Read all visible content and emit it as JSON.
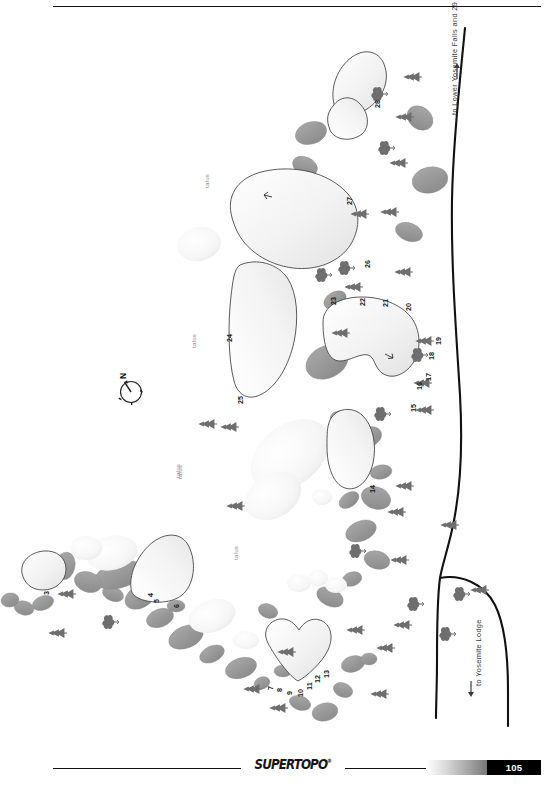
{
  "page": {
    "publisher": "SUPERTOPO",
    "registered_mark": "®",
    "page_number": "105",
    "orientation": "landscape-rotated-90"
  },
  "map": {
    "title": "Camp 4 Bouldering Area Topo Map",
    "compass": {
      "label": "N"
    },
    "talus_labels": [
      "talus",
      "talus",
      "talus",
      "talus",
      "talus"
    ],
    "directions": [
      {
        "id": "to-lower-yosemite-falls",
        "text": "to Lower Yosemite Falls and 29",
        "arrow": "up"
      },
      {
        "id": "to-yosemite-lodge",
        "text": "to Yosemite Lodge",
        "arrow": "down"
      }
    ],
    "route_numbers": [
      "3",
      "4",
      "5",
      "6",
      "7",
      "8",
      "9",
      "10",
      "11",
      "12",
      "13",
      "14",
      "15",
      "16",
      "17",
      "18",
      "19",
      "20",
      "21",
      "22",
      "23",
      "24",
      "25",
      "26",
      "27",
      "28"
    ],
    "colors": {
      "boulder_outline": "#3a3a3a",
      "boulder_fill_light": "#f3f3f3",
      "boulder_fill_shadow": "#9a9a9a",
      "tree": "#6b6b6b",
      "bush": "#6b6b6b",
      "trail": "#111111",
      "talus_text": "#8d8d8d"
    }
  }
}
